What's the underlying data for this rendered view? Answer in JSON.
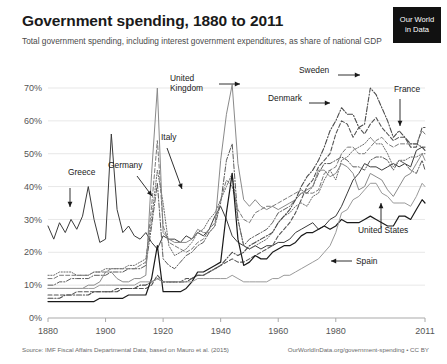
{
  "header": {
    "title": "Government spending, 1880 to 2011",
    "subtitle": "Total government spending, including interest government expenditures, as share of national GDP",
    "logo_line1": "Our World",
    "logo_line2": "in Data"
  },
  "footer": {
    "source": "Source: IMF Fiscal Affairs Departmental Data, based on Mauro et al. (2015)",
    "attribution": "OurWorldInData.org/government-spending • CC BY"
  },
  "chart_data": {
    "type": "line",
    "title": "Government spending, 1880 to 2011",
    "subtitle": "Total government spending, including interest government expenditures, as share of national GDP",
    "xlabel": "",
    "ylabel": "",
    "xlim": [
      1880,
      2011
    ],
    "ylim": [
      0,
      75
    ],
    "grid": true,
    "legend_position": "inline-annotations",
    "ytick_labels": [
      "0%",
      "10%",
      "20%",
      "30%",
      "40%",
      "50%",
      "60%",
      "70%"
    ],
    "ytick_values": [
      0,
      10,
      20,
      30,
      40,
      50,
      60,
      70
    ],
    "xtick_labels": [
      "1880",
      "1900",
      "1920",
      "1940",
      "1960",
      "1980",
      "2011"
    ],
    "xtick_values": [
      1880,
      1900,
      1920,
      1940,
      1960,
      1980,
      2011
    ],
    "x": [
      1880,
      1882,
      1884,
      1886,
      1888,
      1890,
      1892,
      1894,
      1896,
      1898,
      1900,
      1902,
      1904,
      1906,
      1908,
      1910,
      1912,
      1914,
      1916,
      1918,
      1920,
      1922,
      1924,
      1926,
      1928,
      1930,
      1932,
      1934,
      1936,
      1938,
      1940,
      1942,
      1944,
      1946,
      1948,
      1950,
      1952,
      1954,
      1956,
      1958,
      1960,
      1962,
      1964,
      1966,
      1968,
      1970,
      1972,
      1974,
      1976,
      1978,
      1980,
      1982,
      1984,
      1986,
      1988,
      1990,
      1992,
      1994,
      1996,
      1998,
      2000,
      2002,
      2004,
      2006,
      2008,
      2010,
      2011
    ],
    "series": [
      {
        "name": "Greece",
        "color": "#3b3b3b",
        "style": "solid",
        "width": 1.0,
        "values": [
          28,
          24,
          29,
          26,
          30,
          27,
          31,
          40,
          30,
          23,
          24,
          56,
          33,
          26,
          28,
          25,
          24,
          26,
          23,
          21,
          25,
          24,
          24,
          23,
          25,
          24,
          26,
          25,
          27,
          31,
          34,
          30,
          25,
          23,
          22,
          21,
          22,
          21,
          22,
          22,
          23,
          23,
          24,
          26,
          27,
          28,
          29,
          27,
          28,
          30,
          31,
          34,
          38,
          42,
          44,
          47,
          46,
          46,
          45,
          46,
          47,
          46,
          47,
          46,
          51,
          52,
          52
        ]
      },
      {
        "name": "Germany",
        "color": "#5a5a5a",
        "style": "dashdot",
        "width": 1.0,
        "values": [
          10,
          10,
          11,
          11,
          12,
          12,
          12,
          12,
          13,
          13,
          13,
          14,
          14,
          14,
          15,
          15,
          15,
          16,
          28,
          41,
          18,
          16,
          15,
          17,
          19,
          20,
          22,
          23,
          26,
          28,
          35,
          48,
          53,
          30,
          22,
          24,
          25,
          26,
          27,
          29,
          32,
          33,
          34,
          36,
          38,
          38,
          40,
          44,
          47,
          47,
          48,
          49,
          48,
          46,
          46,
          45,
          48,
          49,
          49,
          48,
          45,
          48,
          47,
          45,
          44,
          48,
          45
        ]
      },
      {
        "name": "Italy",
        "color": "#6b6b6b",
        "style": "dotted",
        "width": 1.0,
        "values": [
          13,
          13,
          14,
          14,
          14,
          13,
          13,
          13,
          14,
          14,
          15,
          15,
          15,
          15,
          16,
          16,
          17,
          18,
          30,
          45,
          35,
          22,
          19,
          20,
          21,
          23,
          26,
          27,
          30,
          32,
          36,
          40,
          44,
          30,
          22,
          21,
          22,
          23,
          24,
          26,
          29,
          31,
          32,
          34,
          35,
          34,
          37,
          38,
          42,
          45,
          42,
          48,
          49,
          51,
          52,
          53,
          55,
          53,
          53,
          50,
          46,
          48,
          48,
          49,
          49,
          50,
          50
        ]
      },
      {
        "name": "United Kingdom",
        "color": "#8a8a8a",
        "style": "solid",
        "width": 1.0,
        "values": [
          9,
          9,
          9,
          9,
          9,
          9,
          9,
          10,
          10,
          11,
          14,
          14,
          12,
          11,
          11,
          12,
          12,
          13,
          44,
          70,
          26,
          24,
          23,
          23,
          23,
          24,
          27,
          26,
          26,
          28,
          48,
          62,
          71,
          47,
          36,
          34,
          36,
          34,
          33,
          34,
          33,
          34,
          35,
          36,
          38,
          39,
          40,
          45,
          45,
          43,
          44,
          47,
          46,
          44,
          39,
          40,
          44,
          43,
          42,
          39,
          37,
          40,
          43,
          44,
          47,
          50,
          48
        ]
      },
      {
        "name": "Sweden",
        "color": "#4a4a4a",
        "style": "dashdot",
        "width": 1.1,
        "values": [
          6,
          6,
          6,
          7,
          7,
          7,
          7,
          7,
          8,
          8,
          8,
          8,
          8,
          9,
          9,
          9,
          10,
          10,
          11,
          12,
          11,
          11,
          11,
          11,
          11,
          12,
          13,
          13,
          14,
          15,
          16,
          18,
          20,
          19,
          20,
          22,
          23,
          24,
          25,
          26,
          29,
          31,
          33,
          36,
          40,
          43,
          45,
          48,
          52,
          57,
          60,
          64,
          62,
          62,
          58,
          59,
          70,
          68,
          64,
          60,
          55,
          57,
          55,
          53,
          53,
          52,
          51
        ]
      },
      {
        "name": "Denmark",
        "color": "#555555",
        "style": "dashed",
        "width": 1.1,
        "values": [
          7,
          7,
          7,
          7,
          7,
          8,
          8,
          8,
          8,
          8,
          8,
          8,
          9,
          9,
          9,
          9,
          9,
          9,
          10,
          13,
          11,
          11,
          11,
          11,
          12,
          12,
          13,
          13,
          14,
          15,
          16,
          17,
          18,
          17,
          17,
          18,
          19,
          20,
          21,
          22,
          25,
          27,
          29,
          32,
          36,
          40,
          42,
          46,
          48,
          50,
          56,
          60,
          59,
          55,
          58,
          56,
          59,
          61,
          58,
          56,
          54,
          55,
          55,
          52,
          52,
          58,
          58
        ]
      },
      {
        "name": "France",
        "color": "#7a7a7a",
        "style": "dashed",
        "width": 1.0,
        "values": [
          12,
          12,
          13,
          13,
          13,
          13,
          13,
          13,
          14,
          14,
          14,
          15,
          15,
          15,
          15,
          15,
          16,
          17,
          34,
          54,
          28,
          23,
          22,
          21,
          20,
          21,
          23,
          24,
          27,
          29,
          36,
          42,
          40,
          33,
          30,
          29,
          32,
          33,
          34,
          34,
          35,
          36,
          37,
          38,
          39,
          38,
          38,
          39,
          44,
          45,
          46,
          50,
          52,
          52,
          50,
          50,
          52,
          54,
          55,
          53,
          52,
          53,
          53,
          53,
          53,
          57,
          56
        ]
      },
      {
        "name": "United States",
        "color": "#1a1a1a",
        "style": "solid",
        "width": 1.2,
        "values": [
          5,
          5,
          5,
          5,
          5,
          5,
          5,
          5,
          5,
          6,
          6,
          6,
          6,
          6,
          7,
          7,
          7,
          7,
          12,
          22,
          8,
          8,
          8,
          8,
          9,
          11,
          14,
          14,
          15,
          16,
          17,
          32,
          44,
          24,
          16,
          17,
          19,
          18,
          18,
          20,
          21,
          22,
          22,
          23,
          25,
          26,
          26,
          27,
          28,
          27,
          28,
          30,
          29,
          29,
          29,
          30,
          31,
          30,
          29,
          28,
          28,
          31,
          31,
          30,
          33,
          36,
          35
        ]
      },
      {
        "name": "Spain",
        "color": "#9a9a9a",
        "style": "solid",
        "width": 1.0,
        "values": [
          9,
          9,
          9,
          9,
          9,
          9,
          9,
          9,
          9,
          10,
          10,
          10,
          10,
          10,
          10,
          10,
          11,
          11,
          11,
          12,
          11,
          11,
          11,
          11,
          11,
          11,
          12,
          12,
          12,
          12,
          12,
          12,
          13,
          12,
          11,
          11,
          11,
          11,
          11,
          12,
          12,
          13,
          13,
          14,
          15,
          16,
          17,
          18,
          20,
          22,
          26,
          32,
          33,
          36,
          37,
          39,
          41,
          41,
          38,
          37,
          35,
          35,
          35,
          34,
          37,
          41,
          40
        ]
      }
    ],
    "annotations": [
      {
        "label": "Greece",
        "x": 68,
        "y": 175,
        "arrow": {
          "x1": 70,
          "y1": 188,
          "x2": 70,
          "y2": 207
        }
      },
      {
        "label": "Germany",
        "x": 108,
        "y": 168,
        "arrow": {
          "x1": 137,
          "y1": 176,
          "x2": 152,
          "y2": 196
        }
      },
      {
        "label": "Italy",
        "x": 161,
        "y": 140,
        "arrow": {
          "x1": 167,
          "y1": 148,
          "x2": 182,
          "y2": 189
        }
      },
      {
        "label": "United Kingdom",
        "x": 170,
        "y": 81,
        "arrow": {
          "x1": 219,
          "y1": 84,
          "x2": 240,
          "y2": 84
        }
      },
      {
        "label": "Sweden",
        "x": 299,
        "y": 73,
        "arrow": {
          "x1": 338,
          "y1": 75,
          "x2": 360,
          "y2": 75
        }
      },
      {
        "label": "Denmark",
        "x": 268,
        "y": 101,
        "arrow": {
          "x1": 309,
          "y1": 103,
          "x2": 330,
          "y2": 103
        }
      },
      {
        "label": "France",
        "x": 394,
        "y": 92,
        "arrow": {
          "x1": 400,
          "y1": 99,
          "x2": 400,
          "y2": 126
        }
      },
      {
        "label": "United States",
        "x": 358,
        "y": 233,
        "arrow": {
          "x1": 381,
          "y1": 228,
          "x2": 381,
          "y2": 203
        }
      },
      {
        "label": "Spain",
        "x": 356,
        "y": 264,
        "arrow": {
          "x1": 352,
          "y1": 261,
          "x2": 331,
          "y2": 261
        }
      }
    ]
  }
}
